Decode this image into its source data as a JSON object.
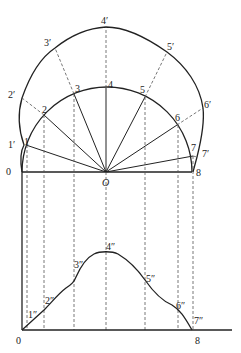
{
  "diagram": {
    "center": {
      "label": "O",
      "x": 106,
      "y": 172
    },
    "base_labels": {
      "left": "0",
      "right": "8"
    },
    "inner_points": [
      {
        "label": "1",
        "x": 26,
        "y": 145
      },
      {
        "label": "2",
        "x": 44,
        "y": 115
      },
      {
        "label": "3",
        "x": 74,
        "y": 94
      },
      {
        "label": "4",
        "x": 106,
        "y": 88
      },
      {
        "label": "5",
        "x": 145,
        "y": 97
      },
      {
        "label": "6",
        "x": 177,
        "y": 125
      },
      {
        "label": "7",
        "x": 193,
        "y": 156
      }
    ],
    "outer_points": [
      {
        "label": "1′",
        "x": 24,
        "y": 145
      },
      {
        "label": "2′",
        "x": 22,
        "y": 98
      },
      {
        "label": "3′",
        "x": 55,
        "y": 48
      },
      {
        "label": "4′",
        "x": 106,
        "y": 27
      },
      {
        "label": "5′",
        "x": 167,
        "y": 52
      },
      {
        "label": "6′",
        "x": 203,
        "y": 108
      },
      {
        "label": "7′",
        "x": 197,
        "y": 157
      }
    ],
    "profile_points": [
      {
        "label": "1″",
        "x": 27,
        "y": 323
      },
      {
        "label": "2″",
        "x": 44,
        "y": 310
      },
      {
        "label": "3″",
        "x": 74,
        "y": 279
      },
      {
        "label": "4″",
        "x": 106,
        "y": 252
      },
      {
        "label": "5″",
        "x": 145,
        "y": 279
      },
      {
        "label": "6″",
        "x": 178,
        "y": 311
      },
      {
        "label": "7″",
        "x": 192,
        "y": 330
      }
    ],
    "bottom_axis": {
      "left_label": "0",
      "right_label": "8"
    }
  }
}
